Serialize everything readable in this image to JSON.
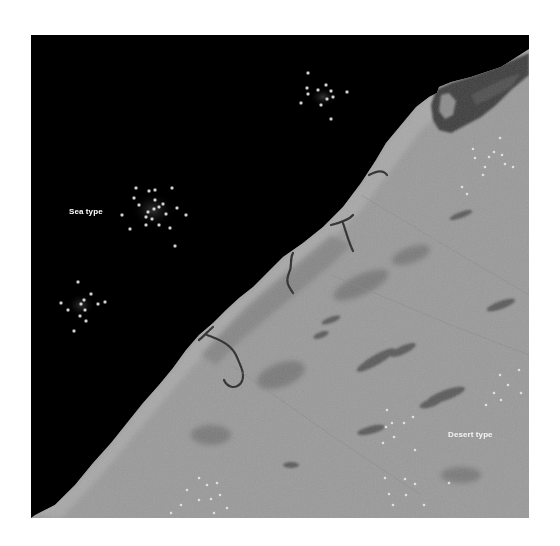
{
  "image": {
    "description": "Grayscale satellite image of a coastline with sea (black) at upper-left and desert land (gray) at lower-right, with clusters of bright point targets",
    "colors": {
      "sea": "#000000",
      "land": "#9a9a9a",
      "land_dark": "#5a5a5a",
      "target": "#e8e8e8",
      "label": "#ffffff",
      "background": "#ffffff"
    }
  },
  "labels": {
    "sea": "Sea type",
    "desert": "Desert type"
  }
}
